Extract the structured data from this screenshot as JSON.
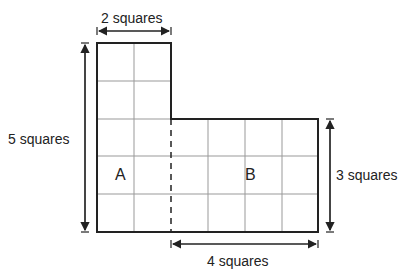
{
  "labels": {
    "top_width": "2 squares",
    "left_height": "5 squares",
    "right_height": "3 squares",
    "bottom_width": "4 squares",
    "region_a": "A",
    "region_b": "B"
  },
  "shape": {
    "square_size_px": 37,
    "left_part": {
      "cols": 2,
      "rows": 5
    },
    "right_part": {
      "cols": 4,
      "rows": 3
    },
    "divider": "dashed"
  },
  "colors": {
    "outline": "#222222",
    "grid": "#999999"
  }
}
